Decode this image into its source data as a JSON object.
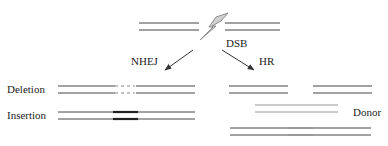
{
  "colors": {
    "strand": "#444444",
    "strand_light": "#9a9a9a",
    "insertion": "#222222",
    "bolt_fill": "#cfcfcf",
    "bolt_stroke": "#777777",
    "arrow": "#333333"
  },
  "labels": {
    "dsb": "DSB",
    "nhej": "NHEJ",
    "hr": "HR",
    "deletion": "Deletion",
    "insertion": "Insertion",
    "donor": "Donor"
  },
  "icons": {
    "break": "lightning-bolt-icon",
    "arrow_left": "arrow-down-left-icon",
    "arrow_right": "arrow-down-right-icon"
  }
}
